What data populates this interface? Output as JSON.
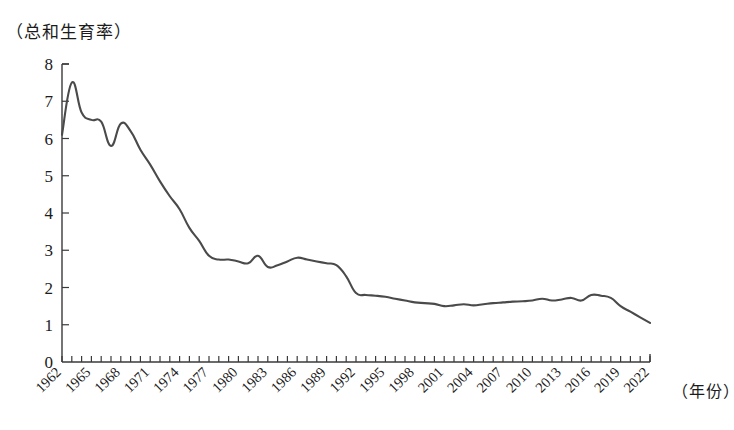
{
  "chart_data": {
    "type": "line",
    "title": "",
    "ylabel": "（总和生育率）",
    "xlabel": "（年份）",
    "ylim": [
      0,
      8
    ],
    "xlim": [
      1962,
      2022
    ],
    "grid": false,
    "legend": "none",
    "y_ticks": [
      "0",
      "1",
      "2",
      "3",
      "4",
      "5",
      "6",
      "7",
      "8"
    ],
    "x_ticks": [
      "1962",
      "1965",
      "1968",
      "1971",
      "1974",
      "1977",
      "1980",
      "1983",
      "1986",
      "1989",
      "1992",
      "1995",
      "1998",
      "2001",
      "2004",
      "2007",
      "2010",
      "2013",
      "2016",
      "2019",
      "2022"
    ],
    "x_tick_interval_years": 3,
    "minor_tick_interval_years": 1,
    "line_color": "#4a4a4a",
    "series": [
      {
        "name": "总和生育率",
        "x": [
          1962,
          1963,
          1964,
          1965,
          1966,
          1967,
          1968,
          1969,
          1970,
          1971,
          1972,
          1973,
          1974,
          1975,
          1976,
          1977,
          1978,
          1979,
          1980,
          1981,
          1982,
          1983,
          1984,
          1985,
          1986,
          1987,
          1988,
          1989,
          1990,
          1991,
          1992,
          1993,
          1994,
          1995,
          1996,
          1997,
          1998,
          1999,
          2000,
          2001,
          2002,
          2003,
          2004,
          2005,
          2006,
          2007,
          2008,
          2009,
          2010,
          2011,
          2012,
          2013,
          2014,
          2015,
          2016,
          2017,
          2018,
          2019,
          2020,
          2021,
          2022
        ],
        "values": [
          6.1,
          7.5,
          6.7,
          6.5,
          6.45,
          5.8,
          6.4,
          6.2,
          5.7,
          5.3,
          4.85,
          4.45,
          4.1,
          3.6,
          3.25,
          2.85,
          2.75,
          2.75,
          2.7,
          2.65,
          2.85,
          2.55,
          2.6,
          2.7,
          2.8,
          2.75,
          2.7,
          2.65,
          2.6,
          2.3,
          1.85,
          1.8,
          1.78,
          1.75,
          1.7,
          1.65,
          1.6,
          1.58,
          1.56,
          1.5,
          1.52,
          1.55,
          1.52,
          1.55,
          1.58,
          1.6,
          1.62,
          1.63,
          1.65,
          1.7,
          1.65,
          1.68,
          1.72,
          1.65,
          1.8,
          1.78,
          1.72,
          1.5,
          1.35,
          1.2,
          1.05
        ]
      }
    ]
  }
}
